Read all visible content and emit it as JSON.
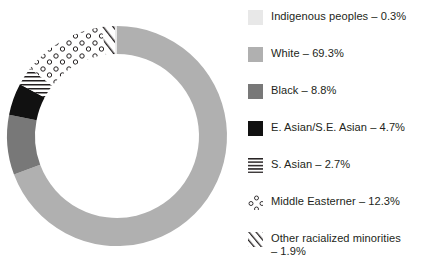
{
  "chart_data": {
    "type": "pie",
    "variant": "donut",
    "title": "",
    "subtitle": "",
    "xlabel": "",
    "ylabel": "",
    "grid": false,
    "legend_position": "right",
    "start_angle_deg": 0,
    "direction": "clockwise",
    "units": "percent",
    "total": 100.0,
    "categories": [
      "White",
      "Black",
      "E. Asian/S.E. Asian",
      "S. Asian",
      "Middle Easterner",
      "Other racialized minorities",
      "Indigenous peoples"
    ],
    "values": [
      69.3,
      8.8,
      4.7,
      2.7,
      12.3,
      1.9,
      0.3
    ],
    "slices": [
      {
        "name": "White",
        "value": 69.3,
        "value_label": "69.3%",
        "fill": "#b0b0b0",
        "pattern": "solid",
        "start_deg": 0,
        "end_deg": 249.48
      },
      {
        "name": "Black",
        "value": 8.8,
        "value_label": "8.8%",
        "fill": "#787878",
        "pattern": "solid",
        "start_deg": 249.48,
        "end_deg": 281.16
      },
      {
        "name": "E. Asian/S.E. Asian",
        "value": 4.7,
        "value_label": "4.7%",
        "fill": "#111111",
        "pattern": "solid",
        "start_deg": 281.16,
        "end_deg": 298.08
      },
      {
        "name": "S. Asian",
        "value": 2.7,
        "value_label": "2.7%",
        "fill": "#ffffff",
        "pattern": "horizontal-lines",
        "start_deg": 298.08,
        "end_deg": 307.8
      },
      {
        "name": "Middle Easterner",
        "value": 12.3,
        "value_label": "12.3%",
        "fill": "#ffffff",
        "pattern": "small-circles",
        "start_deg": 307.8,
        "end_deg": 352.08
      },
      {
        "name": "Other racialized minorities",
        "value": 1.9,
        "value_label": "1.9%",
        "fill": "#ffffff",
        "pattern": "diagonal-lines",
        "start_deg": 352.08,
        "end_deg": 358.92
      },
      {
        "name": "Indigenous peoples",
        "value": 0.3,
        "value_label": "0.3%",
        "fill": "#e8e8e8",
        "pattern": "solid",
        "start_deg": 358.92,
        "end_deg": 360
      }
    ]
  },
  "legend": {
    "items": [
      {
        "label": "Indigenous peoples – 0.3%",
        "name": "Indigenous peoples",
        "value_label": "0.3%",
        "swatch": "solid-swatch-indigenous",
        "color": "#e8e8e8"
      },
      {
        "label": "White – 69.3%",
        "name": "White",
        "value_label": "69.3%",
        "swatch": "solid-swatch-white",
        "color": "#b0b0b0"
      },
      {
        "label": "Black – 8.8%",
        "name": "Black",
        "value_label": "8.8%",
        "swatch": "solid-swatch-black",
        "color": "#787878"
      },
      {
        "label": "E. Asian/S.E. Asian – 4.7%",
        "name": "E. Asian/S.E. Asian",
        "value_label": "4.7%",
        "swatch": "solid-swatch-easian",
        "color": "#111111"
      },
      {
        "label": "S. Asian – 2.7%",
        "name": "S. Asian",
        "value_label": "2.7%",
        "swatch": "horizontal-lines-swatch",
        "color": "#231f20"
      },
      {
        "label": "Middle Easterner – 12.3%",
        "name": "Middle Easterner",
        "value_label": "12.3%",
        "swatch": "small-circles-swatch",
        "color": "#231f20"
      },
      {
        "label": "Other racialized minorities\n– 1.9%",
        "name": "Other racialized minorities",
        "value_label": "1.9%",
        "swatch": "diagonal-lines-swatch",
        "color": "#231f20"
      }
    ]
  }
}
